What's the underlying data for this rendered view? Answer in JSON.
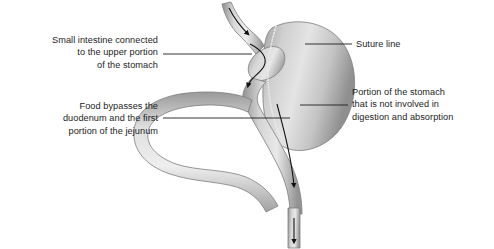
{
  "figure": {
    "background_color": "#ffffff",
    "line_color": "#1d1d1d",
    "text_color": "#1d1d1d",
    "organ_light": "#e8e8e8",
    "organ_mid": "#b9b9b9",
    "organ_dark": "#8a8a8a",
    "organ_shadow": "#6f6f6f",
    "suture_color": "#f4f4f4"
  },
  "labels": [
    {
      "id": "small-intestine",
      "text": "Small intestine connected\nto the upper portion\nof the stomach",
      "side": "left",
      "leader": {
        "x1": 163,
        "y1": 54,
        "x2": 252,
        "y2": 54
      }
    },
    {
      "id": "food-bypass",
      "text": "Food bypasses the\nduodenum and the first\nportion of the jejunum",
      "side": "left",
      "leader": {
        "x1": 163,
        "y1": 118,
        "x2": 290,
        "y2": 118
      }
    },
    {
      "id": "suture-line",
      "text": "Suture line",
      "side": "right",
      "leader": {
        "x1": 305,
        "y1": 44,
        "x2": 352,
        "y2": 44
      }
    },
    {
      "id": "not-involved",
      "text": "Portion of the stomach\nthat is not involved in\ndigestion and absorption",
      "side": "right",
      "leader": {
        "x1": 300,
        "y1": 105,
        "x2": 348,
        "y2": 105
      }
    }
  ],
  "anatomy": {
    "parts": [
      {
        "name": "esophagus",
        "description": "Tube entering from top, angled down-right into the gastric pouch"
      },
      {
        "name": "gastric-pouch",
        "description": "Small upper stomach pouch receiving the esophagus"
      },
      {
        "name": "bypassed-stomach",
        "description": "Large rounded remnant stomach on the right, separated by the suture line"
      },
      {
        "name": "suture-line",
        "description": "Dotted staple line curving between the pouch and the bypassed stomach"
      },
      {
        "name": "duodenum-loop",
        "description": "Bypassed duodenum and proximal jejunum looping to the left"
      },
      {
        "name": "roux-limb",
        "description": "Limb of small intestine descending from the pouch along the right"
      },
      {
        "name": "jejunojejunal-anastomosis",
        "description": "Junction where the bypassed limb rejoins the Roux limb at the bottom"
      }
    ],
    "flow_arrows": [
      {
        "name": "flow-arrow-esophagus",
        "description": "Downward arrow inside the esophagus"
      },
      {
        "name": "flow-arrow-pouch-outlet",
        "description": "Downward arrow leaving the pouch into the Roux limb"
      },
      {
        "name": "flow-arrow-roux-limb",
        "description": "Long downward arrow along the Roux limb"
      },
      {
        "name": "flow-arrow-distal",
        "description": "Short downward arrow at the distal bowel"
      }
    ]
  }
}
